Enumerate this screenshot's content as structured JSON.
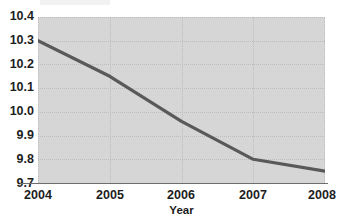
{
  "chart_data": {
    "type": "line",
    "title": "",
    "subtitle": "",
    "xlabel": "Year",
    "ylabel": "",
    "x": [
      2004,
      2005,
      2006,
      2007,
      2008
    ],
    "categories": [
      "2004",
      "2005",
      "2006",
      "2007",
      "2008"
    ],
    "values": [
      10.3,
      10.15,
      9.96,
      9.8,
      9.75
    ],
    "series": [
      {
        "name": "",
        "values": [
          10.3,
          10.15,
          9.96,
          9.8,
          9.75
        ]
      }
    ],
    "xlim": [
      2004,
      2008
    ],
    "ylim": [
      9.7,
      10.4
    ],
    "ytick_labels": [
      "10.4",
      "10.3",
      "10.2",
      "10.1",
      "10.0",
      "9.9",
      "9.8",
      "9.7"
    ],
    "ytick_values": [
      10.4,
      10.3,
      10.2,
      10.1,
      10.0,
      9.9,
      9.8,
      9.7
    ],
    "xtick_labels": [
      "2004",
      "2005",
      "2006",
      "2007",
      "2008"
    ],
    "xtick_values": [
      2004,
      2005,
      2006,
      2007,
      2008
    ],
    "grid": true,
    "legend": false,
    "legend_position": "none",
    "line_color": "#595959",
    "plot_background_color": "#d6d6d6",
    "figure_background_color": "#ffffff",
    "grid_color": "#bdbdbd",
    "axis_color": "#6e6e6e",
    "text_color": "#1d1d1d"
  }
}
